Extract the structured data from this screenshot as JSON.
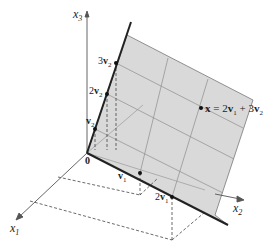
{
  "figure": {
    "axes": {
      "x1": {
        "label": "x",
        "sub": "1"
      },
      "x2": {
        "label": "x",
        "sub": "2"
      },
      "x3": {
        "label": "x",
        "sub": "3"
      }
    },
    "origin_label": "0",
    "points": {
      "v1": {
        "coef": "",
        "vec": "v",
        "sub": "1"
      },
      "two_v1": {
        "coef": "2",
        "vec": "v",
        "sub": "1"
      },
      "v2": {
        "coef": "",
        "vec": "v",
        "sub": "2"
      },
      "two_v2": {
        "coef": "2",
        "vec": "v",
        "sub": "2"
      },
      "three_v2": {
        "coef": "3",
        "vec": "v",
        "sub": "2"
      }
    },
    "x_point": {
      "vec": "x",
      "eq": " = 2",
      "v1": "v",
      "v1_sub": "1",
      "plus": " + 3",
      "v2": "v",
      "v2_sub": "2"
    },
    "colors": {
      "plane_fill": "#d9d9d9",
      "plane_grid": "#8c8c8c",
      "axis": "#555555",
      "span_line": "#222222",
      "dashed": "#444444"
    }
  }
}
